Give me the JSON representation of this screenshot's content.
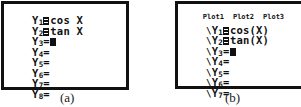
{
  "panels": [
    {
      "caption": "(a)",
      "rows": [
        {
          "var": "Y",
          "index": "1",
          "selected": true,
          "expr": "cos X"
        },
        {
          "var": "Y",
          "index": "2",
          "selected": true,
          "expr": "tan X"
        },
        {
          "var": "Y",
          "index": "3",
          "selected": false,
          "eq": "=",
          "cursor": true,
          "expr": ""
        },
        {
          "var": "Y",
          "index": "4",
          "selected": false,
          "eq": "=",
          "expr": ""
        },
        {
          "var": "Y",
          "index": "5",
          "selected": false,
          "eq": "=",
          "expr": ""
        },
        {
          "var": "Y",
          "index": "6",
          "selected": false,
          "eq": "=",
          "expr": ""
        },
        {
          "var": "Y",
          "index": "7",
          "selected": false,
          "eq": "=",
          "expr": ""
        },
        {
          "var": "Y",
          "index": "8",
          "selected": false,
          "eq": "=",
          "expr": ""
        }
      ]
    },
    {
      "caption": "(b)",
      "plots": [
        "Plot1",
        "Plot2",
        "Plot3"
      ],
      "line_style_icon": "\\",
      "rows": [
        {
          "var": "Y",
          "index": "1",
          "selected": true,
          "expr": "cos(X)"
        },
        {
          "var": "Y",
          "index": "2",
          "selected": true,
          "expr": "tan(X)"
        },
        {
          "var": "Y",
          "index": "3",
          "selected": false,
          "eq": "=",
          "cursor": true,
          "expr": ""
        },
        {
          "var": "Y",
          "index": "4",
          "selected": false,
          "eq": "=",
          "expr": ""
        },
        {
          "var": "Y",
          "index": "5",
          "selected": false,
          "eq": "=",
          "expr": ""
        },
        {
          "var": "Y",
          "index": "6",
          "selected": false,
          "eq": "=",
          "expr": ""
        },
        {
          "var": "Y",
          "index": "7",
          "selected": false,
          "eq": "=",
          "expr": ""
        }
      ]
    }
  ]
}
